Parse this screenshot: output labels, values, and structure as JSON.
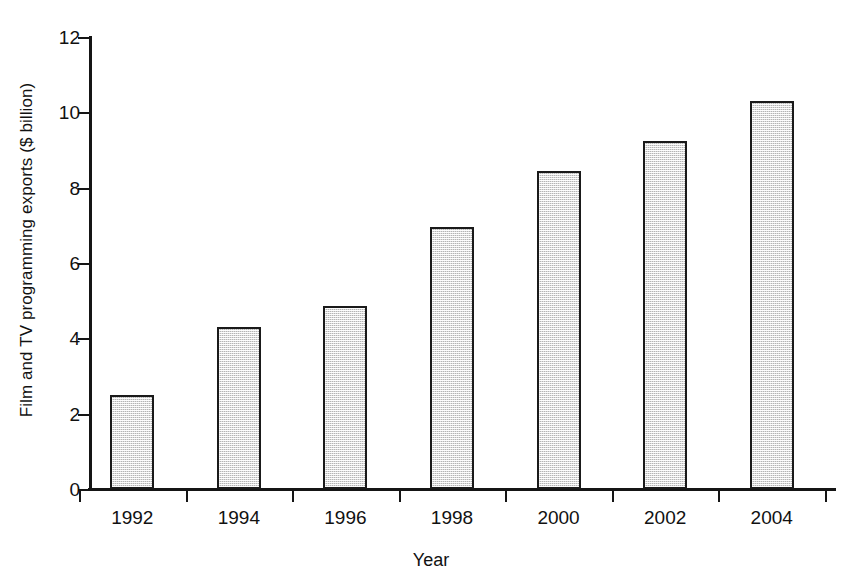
{
  "chart_data": {
    "type": "bar",
    "title": "",
    "categories": [
      "1992",
      "1994",
      "1996",
      "1998",
      "2000",
      "2002",
      "2004"
    ],
    "values": [
      2.5,
      4.3,
      4.85,
      6.95,
      8.45,
      9.25,
      10.3
    ],
    "xlabel": "Year",
    "ylabel": "Film and TV programming exports ($ billion)",
    "ylim": [
      0,
      12
    ],
    "ytick_labels": [
      "0",
      "2",
      "4",
      "6",
      "8",
      "10",
      "12"
    ],
    "ytick_values": [
      0,
      2,
      4,
      6,
      8,
      10,
      12
    ],
    "grid": false,
    "legend": false,
    "bar_fill_color": "#b4b4b4",
    "bar_edge_color": "#1a1a1a",
    "background_color": "#ffffff",
    "axis_color": "#151515"
  }
}
